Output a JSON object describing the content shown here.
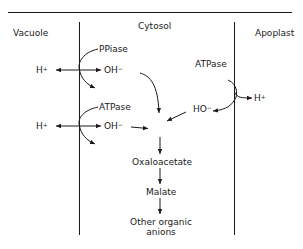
{
  "compartments": {
    "vacuole": "Vacuole",
    "cytosol": "Cytosol",
    "apoplast": "Apoplast"
  },
  "enzymes": {
    "ppiase": "PPiase",
    "atpase_tonoplast": "ATPase",
    "atpase_plasma": "ATPase"
  },
  "ions": {
    "h_vac_1": "H",
    "h_vac_2": "H",
    "h_apo": "H",
    "plus": "+",
    "oh_1": "OH",
    "oh_2": "OH",
    "ho": "HO",
    "minus": "−"
  },
  "pathway": {
    "step1": "Oxaloacetate",
    "step2": "Malate",
    "step3_line1": "Other organic",
    "step3_line2": "anions"
  },
  "colors": {
    "ink": "#1a1a1a",
    "background": "#ffffff"
  }
}
